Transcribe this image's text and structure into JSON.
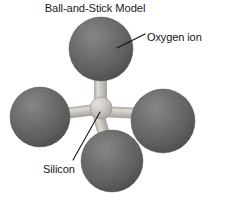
{
  "figure": {
    "title": "Ball-and-Stick Model",
    "background_color": "#ffffff",
    "text_color": "#151515",
    "width": 227,
    "height": 200
  },
  "labels": {
    "oxygen_ion": "Oxygen ion",
    "silicon": "Silicon"
  },
  "model": {
    "description": "Silicate tetrahedron ball-and-stick model",
    "sphere_color_dark": "#6d6d6d",
    "sphere_color_shadow": "#4a4a4a",
    "sphere_highlight": "#8e8e8e",
    "center_atom_color": "#c9c7c2",
    "bond_color": "#bdbbb6",
    "leader_line_color": "#1a1a1a",
    "atoms": [
      {
        "name": "oxygen-ion-top",
        "element": "O",
        "cx": 101,
        "cy": 49,
        "r": 32
      },
      {
        "name": "oxygen-ion-left",
        "element": "O",
        "cx": 40,
        "cy": 117,
        "r": 30
      },
      {
        "name": "oxygen-ion-right",
        "element": "O",
        "cx": 162,
        "cy": 120,
        "r": 32
      },
      {
        "name": "oxygen-ion-bottom",
        "element": "O",
        "cx": 112,
        "cy": 160,
        "r": 31
      },
      {
        "name": "silicon-center",
        "element": "Si",
        "cx": 101,
        "cy": 108,
        "r": 10
      }
    ],
    "bonds": [
      {
        "name": "bond-center-top",
        "x1": 101,
        "y1": 108,
        "x2": 101,
        "y2": 72
      },
      {
        "name": "bond-center-left",
        "x1": 101,
        "y1": 108,
        "x2": 66,
        "y2": 120
      },
      {
        "name": "bond-center-right",
        "x1": 101,
        "y1": 108,
        "x2": 135,
        "y2": 116
      },
      {
        "name": "bond-center-bottom",
        "x1": 101,
        "y1": 108,
        "x2": 111,
        "y2": 134
      }
    ],
    "leader_lines": [
      {
        "name": "leader-oxygen-ion",
        "x1": 145,
        "y1": 35,
        "x2": 118,
        "y2": 48
      },
      {
        "name": "leader-silicon",
        "x1": 100,
        "y1": 112,
        "x2": 72,
        "y2": 161
      }
    ]
  }
}
